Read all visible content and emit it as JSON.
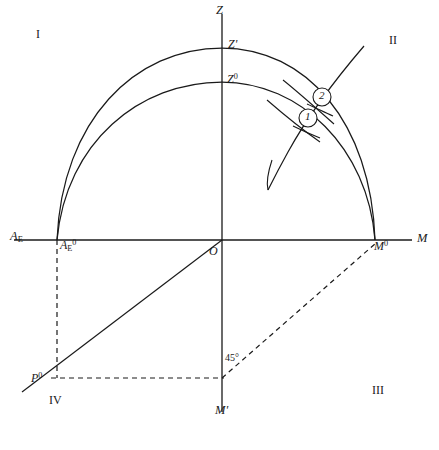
{
  "figure": {
    "type": "geometric-diagram",
    "background_color": "#ffffff",
    "line_color": "#1a1a1a"
  },
  "axes": {
    "vertical": {
      "top_label": "Z",
      "bottom_label": "M'",
      "x": 222,
      "top_y": 14,
      "bottom_y": 412
    },
    "horizontal": {
      "left_label": "A",
      "left_label_sub": "E",
      "right_label": "M",
      "y": 240,
      "left_x": 14,
      "right_x": 412
    },
    "origin_label": "O"
  },
  "quadrants": [
    {
      "name": "I",
      "label": "I",
      "x": 38,
      "y": 34
    },
    {
      "name": "II",
      "label": "II",
      "x": 391,
      "y": 40
    },
    {
      "name": "III",
      "label": "III",
      "x": 374,
      "y": 390
    },
    {
      "name": "IV",
      "label": "IV",
      "x": 51,
      "y": 400
    }
  ],
  "points": [
    {
      "name": "zenith-prime",
      "label": "Z",
      "sup": "'",
      "x": 230,
      "y": 44
    },
    {
      "name": "zenith-zero",
      "label": "Z",
      "sup": "0",
      "x": 229,
      "y": 79
    },
    {
      "name": "ae-zero",
      "label": "A",
      "sub": "E",
      "sup": "0",
      "x": 61,
      "y": 243
    },
    {
      "name": "m-zero",
      "label": "M",
      "sup": "0",
      "x": 378,
      "y": 243
    },
    {
      "name": "p-zero",
      "label": "P",
      "sup": "0",
      "x": 35,
      "y": 378
    },
    {
      "name": "origin",
      "label": "O",
      "x": 211,
      "y": 250
    }
  ],
  "angle_marks": [
    {
      "name": "angle-45",
      "label": "45",
      "symbol": "°",
      "x": 225,
      "y": 358
    }
  ],
  "callouts": [
    {
      "name": "callout-1",
      "label": "1",
      "cx": 308,
      "cy": 118,
      "r": 9
    },
    {
      "name": "callout-2",
      "label": "2",
      "cx": 322,
      "cy": 97,
      "r": 9
    }
  ],
  "arcs": {
    "outer": {
      "name": "outer-arc",
      "apex_label": "Z'",
      "left_x": 57,
      "right_x": 375,
      "apex_y": 48,
      "base_y": 240
    },
    "inner": {
      "name": "inner-arc",
      "apex_label": "Z0",
      "left_x": 57,
      "right_x": 375,
      "apex_y": 82,
      "base_y": 240
    }
  },
  "construction_lines": {
    "solid_oblique": {
      "name": "oblique-line",
      "from": [
        222,
        240
      ],
      "to": [
        22,
        392
      ]
    },
    "dashed_vertical": {
      "name": "dashed-vertical-ae",
      "from": [
        57,
        240
      ],
      "to": [
        57,
        378
      ]
    },
    "dashed_horizontal": {
      "name": "dashed-horizontal-p",
      "from": [
        51,
        378
      ],
      "to": [
        222,
        378
      ]
    },
    "dashed_diagonal": {
      "name": "dashed-diagonal-45",
      "from": [
        222,
        378
      ],
      "to": [
        375,
        243
      ]
    }
  }
}
